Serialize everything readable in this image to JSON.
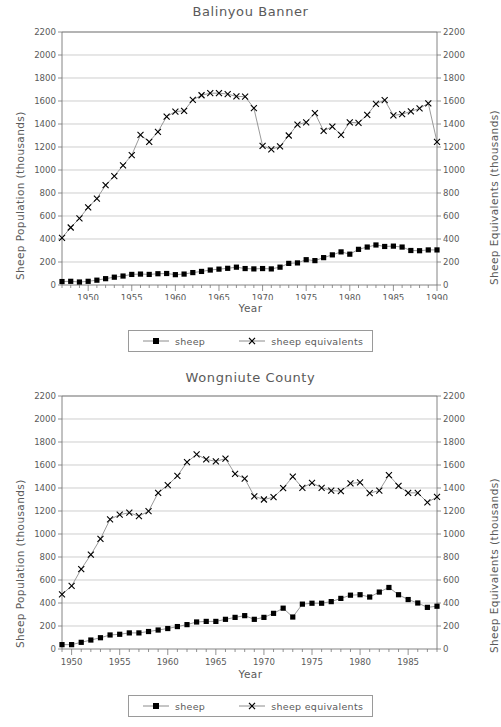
{
  "page": {
    "background": "#ffffff",
    "text_color": "#5a5a5a",
    "line_color": "#808080",
    "marker_color": "#000000"
  },
  "common": {
    "ylabel_left": "Sheep Population (thousands)",
    "ylabel_right": "Sheep Equivalents (thousands)",
    "xlabel": "Year",
    "legend": [
      {
        "label": "sheep",
        "marker": "filled-square-icon"
      },
      {
        "label": "sheep equivalents",
        "marker": "x-cross-icon"
      }
    ],
    "ytick_labels": [
      "0",
      "200",
      "400",
      "600",
      "800",
      "1000",
      "1200",
      "1400",
      "1600",
      "1800",
      "2000",
      "2200"
    ]
  },
  "chart_data": [
    {
      "id": "balinyou-banner",
      "type": "line",
      "title": "Balinyou Banner",
      "xlabel": "Year",
      "ylabel": "Sheep Population (thousands)",
      "ylabel_right": "Sheep Equivalents (thousands)",
      "ylim": [
        0,
        2200
      ],
      "xlim": [
        1947,
        1990
      ],
      "ytick_step": 200,
      "xtick_labels": [
        "1950",
        "1955",
        "1960",
        "1965",
        "1970",
        "1975",
        "1980",
        "1985",
        "1990"
      ],
      "xtick_values": [
        1950,
        1955,
        1960,
        1965,
        1970,
        1975,
        1980,
        1985,
        1990
      ],
      "grid": true,
      "legend_position": "below",
      "x": [
        1947,
        1948,
        1949,
        1950,
        1951,
        1952,
        1953,
        1954,
        1955,
        1956,
        1957,
        1958,
        1959,
        1960,
        1961,
        1962,
        1963,
        1964,
        1965,
        1966,
        1967,
        1968,
        1969,
        1970,
        1971,
        1972,
        1973,
        1974,
        1975,
        1976,
        1977,
        1978,
        1979,
        1980,
        1981,
        1982,
        1983,
        1984,
        1985,
        1986,
        1987,
        1988,
        1989,
        1990
      ],
      "series": [
        {
          "name": "sheep",
          "marker": "filled-square-icon",
          "values": [
            30,
            32,
            26,
            32,
            42,
            55,
            68,
            78,
            92,
            95,
            92,
            98,
            100,
            90,
            95,
            108,
            118,
            130,
            138,
            145,
            155,
            143,
            140,
            143,
            140,
            155,
            188,
            192,
            220,
            212,
            238,
            262,
            288,
            268,
            310,
            330,
            348,
            335,
            338,
            330,
            300,
            298,
            305,
            305
          ]
        },
        {
          "name": "sheep equivalents",
          "marker": "x-cross-icon",
          "values": [
            410,
            500,
            580,
            675,
            752,
            868,
            947,
            1040,
            1130,
            1305,
            1245,
            1332,
            1465,
            1508,
            1515,
            1610,
            1650,
            1668,
            1668,
            1660,
            1640,
            1638,
            1538,
            1210,
            1180,
            1205,
            1300,
            1395,
            1415,
            1495,
            1340,
            1378,
            1305,
            1415,
            1410,
            1480,
            1575,
            1608,
            1475,
            1485,
            1510,
            1535,
            1580,
            1245,
            1240
          ]
        }
      ]
    },
    {
      "id": "wongniute-county",
      "type": "line",
      "title": "Wongniute County",
      "xlabel": "Year",
      "ylabel": "Sheep Population (thousands)",
      "ylabel_right": "Sheep Equivalents (thousands)",
      "ylim": [
        0,
        2200
      ],
      "xlim": [
        1949,
        1988
      ],
      "ytick_step": 200,
      "xtick_labels": [
        "1950",
        "1955",
        "1960",
        "1965",
        "1970",
        "1975",
        "1980",
        "1985"
      ],
      "xtick_values": [
        1950,
        1955,
        1960,
        1965,
        1970,
        1975,
        1980,
        1985
      ],
      "grid": true,
      "legend_position": "below",
      "x": [
        1949,
        1950,
        1951,
        1952,
        1953,
        1954,
        1955,
        1956,
        1957,
        1958,
        1959,
        1960,
        1961,
        1962,
        1963,
        1964,
        1965,
        1966,
        1967,
        1968,
        1969,
        1970,
        1971,
        1972,
        1973,
        1974,
        1975,
        1976,
        1977,
        1978,
        1979,
        1980,
        1981,
        1982,
        1983,
        1984,
        1985,
        1986,
        1987,
        1988
      ],
      "series": [
        {
          "name": "sheep",
          "marker": "filled-square-icon",
          "values": [
            38,
            38,
            58,
            78,
            98,
            122,
            128,
            140,
            140,
            152,
            165,
            178,
            195,
            212,
            235,
            240,
            240,
            258,
            275,
            290,
            258,
            275,
            310,
            355,
            278,
            390,
            398,
            398,
            412,
            440,
            468,
            472,
            452,
            495,
            535,
            472,
            430,
            400,
            362,
            372
          ]
        },
        {
          "name": "sheep equivalents",
          "marker": "x-cross-icon",
          "values": [
            475,
            548,
            695,
            820,
            958,
            1128,
            1168,
            1185,
            1155,
            1198,
            1358,
            1425,
            1505,
            1625,
            1692,
            1648,
            1632,
            1655,
            1522,
            1482,
            1328,
            1300,
            1320,
            1398,
            1498,
            1402,
            1445,
            1402,
            1378,
            1372,
            1440,
            1448,
            1355,
            1378,
            1512,
            1418,
            1358,
            1358,
            1275,
            1322
          ]
        }
      ]
    }
  ]
}
